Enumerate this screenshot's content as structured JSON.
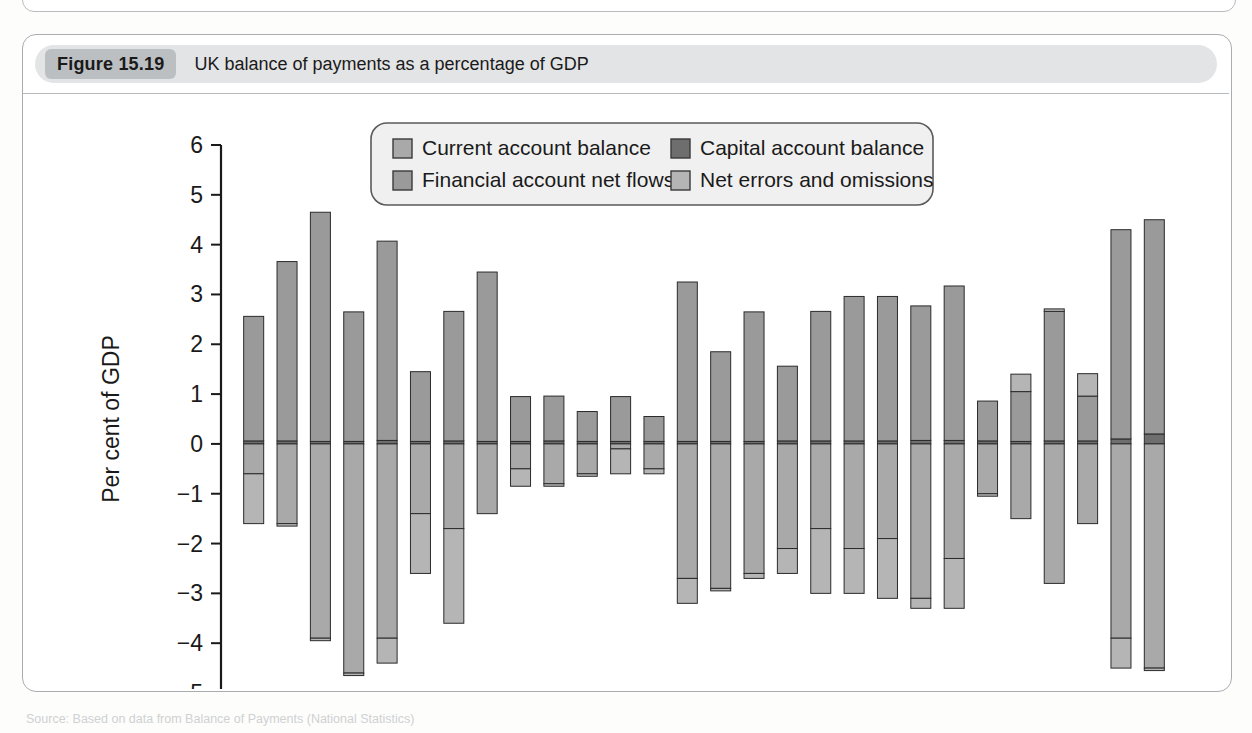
{
  "figure": {
    "tag": "Figure 15.19",
    "title": "UK balance of payments as a percentage of GDP",
    "source_note": "Source: Based on data from Balance of Payments (National Statistics)"
  },
  "colors": {
    "current_account": "#a9a9a9",
    "capital_account": "#6e6e6e",
    "financial_account": "#9a9a9a",
    "net_errors": "#b5b5b5",
    "axis": "#1a1a1a",
    "header_band": "#e3e4e5",
    "tag_bg": "#bcbfc1",
    "frame": "#a9adb0"
  },
  "legend": {
    "position": "top-center-inside",
    "items": [
      {
        "key": "current_account",
        "label": "Current account balance",
        "swatch": "#a9a9a9"
      },
      {
        "key": "capital_account",
        "label": "Capital account balance",
        "swatch": "#6e6e6e"
      },
      {
        "key": "financial_account",
        "label": "Financial account net flows",
        "swatch": "#9a9a9a"
      },
      {
        "key": "net_errors",
        "label": "Net errors and omissions",
        "swatch": "#b5b5b5"
      }
    ]
  },
  "chart_data": {
    "type": "bar",
    "stacked": true,
    "orientation": "vertical",
    "title": "UK balance of payments as a percentage of GDP",
    "xlabel": "",
    "ylabel": "Per cent of GDP",
    "ylim": [
      -5,
      6
    ],
    "yticks": [
      -5,
      -4,
      -3,
      -2,
      -1,
      0,
      1,
      2,
      3,
      4,
      5,
      6
    ],
    "ytick_labels": [
      "−5",
      "−4",
      "−3",
      "−2",
      "−1",
      "0",
      "1",
      "2",
      "3",
      "4",
      "5",
      "6"
    ],
    "grid": false,
    "xtick_labels_shown": [
      "1987",
      "1992",
      "1997",
      "2002",
      "2007",
      "2012"
    ],
    "x": [
      1986,
      1987,
      1988,
      1989,
      1990,
      1991,
      1992,
      1993,
      1994,
      1995,
      1996,
      1997,
      1998,
      1999,
      2000,
      2001,
      2002,
      2003,
      2004,
      2005,
      2006,
      2007,
      2008,
      2009,
      2010,
      2011,
      2012,
      2013
    ],
    "series": [
      {
        "name": "Current account balance",
        "key": "current_account",
        "values": [
          -0.6,
          -1.6,
          -3.9,
          -4.6,
          -3.9,
          -1.4,
          -1.7,
          -1.4,
          -0.5,
          -0.8,
          -0.6,
          -0.1,
          -0.5,
          -2.7,
          -2.9,
          -2.6,
          -2.1,
          -1.7,
          -2.1,
          -1.9,
          -3.1,
          -2.3,
          -1.0,
          -1.5,
          -2.8,
          -1.6,
          -3.9,
          -4.5
        ]
      },
      {
        "name": "Capital account balance",
        "key": "capital_account",
        "values": [
          0.06,
          0.06,
          0.05,
          0.05,
          0.07,
          0.05,
          0.06,
          0.05,
          0.05,
          0.06,
          0.05,
          0.05,
          0.05,
          0.05,
          0.05,
          0.05,
          0.06,
          0.06,
          0.06,
          0.06,
          0.07,
          0.07,
          0.06,
          0.05,
          0.06,
          0.06,
          0.1,
          0.2
        ]
      },
      {
        "name": "Financial account net flows",
        "key": "financial_account",
        "values": [
          2.5,
          3.6,
          4.6,
          2.6,
          4.0,
          1.4,
          2.6,
          3.4,
          0.9,
          0.9,
          0.6,
          0.9,
          0.5,
          3.2,
          1.8,
          2.6,
          1.5,
          2.6,
          2.9,
          2.9,
          2.7,
          3.1,
          0.8,
          1.0,
          2.6,
          0.9,
          4.2,
          4.3
        ]
      },
      {
        "name": "Net errors and omissions",
        "key": "net_errors",
        "values": [
          -1.0,
          -0.05,
          -0.05,
          -0.05,
          -0.5,
          -1.2,
          -1.9,
          0.0,
          -0.35,
          -0.05,
          -0.05,
          -0.5,
          -0.1,
          -0.5,
          -0.05,
          -0.1,
          -0.5,
          -1.3,
          -0.9,
          -1.2,
          -0.2,
          -1.0,
          -0.05,
          0.35,
          0.05,
          0.45,
          -0.6,
          -0.05
        ]
      }
    ]
  }
}
